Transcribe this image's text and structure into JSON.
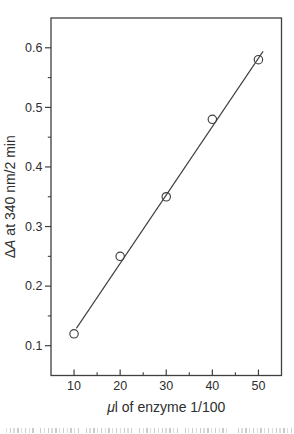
{
  "figure": {
    "kind": "scanned-scatter-plot-figure",
    "background": "#ffffff"
  },
  "chart_data": {
    "type": "scatter",
    "title": "",
    "xlabel": "μl of enzyme 1/100",
    "ylabel": "ΔA at 340 nm/2 min",
    "xlabel_segments": [
      {
        "text": "μ",
        "italic": true
      },
      {
        "text": "l of enzyme 1/100",
        "italic": false
      }
    ],
    "ylabel_segments": [
      {
        "text": "Δ",
        "italic": false
      },
      {
        "text": "A",
        "italic": true
      },
      {
        "text": " at 340 nm/2 min",
        "italic": false
      }
    ],
    "points": [
      {
        "x": 10,
        "y": 0.12
      },
      {
        "x": 20,
        "y": 0.25
      },
      {
        "x": 30,
        "y": 0.35
      },
      {
        "x": 40,
        "y": 0.48
      },
      {
        "x": 50,
        "y": 0.58
      }
    ],
    "fit_line": {
      "x1": 10.5,
      "y1": 0.129,
      "x2": 51.0,
      "y2": 0.594
    },
    "xlim": [
      5,
      55
    ],
    "ylim": [
      0.05,
      0.65
    ],
    "x_major_ticks": [
      10,
      20,
      30,
      40,
      50
    ],
    "x_minor_ticks": [
      15,
      25,
      35,
      45
    ],
    "y_major_ticks": [
      0.1,
      0.2,
      0.3,
      0.4,
      0.5,
      0.6
    ],
    "y_minor_ticks": [
      0.15,
      0.25,
      0.35,
      0.45,
      0.55
    ],
    "y_tick_decimals": 1,
    "grid": false,
    "legend": null,
    "marker": "open-circle",
    "marker_radius_px": 4.2,
    "colors": {
      "frame": "#3f3f3f",
      "line": "#3f3f3f",
      "marker": "#3f3f3f",
      "text": "#2e2e2e"
    }
  }
}
